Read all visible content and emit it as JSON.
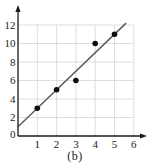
{
  "chart_data": {
    "type": "scatter",
    "title": "",
    "xlabel": "",
    "ylabel": "",
    "caption": "(b)",
    "points": [
      {
        "x": 1,
        "y": 3
      },
      {
        "x": 2,
        "y": 5
      },
      {
        "x": 3,
        "y": 6
      },
      {
        "x": 4,
        "y": 10
      },
      {
        "x": 5,
        "y": 11
      }
    ],
    "fit_line": {
      "x1": 0,
      "y1": 1,
      "x2": 5.6,
      "y2": 12.2
    },
    "xticks": [
      1,
      2,
      3,
      4,
      5,
      6
    ],
    "yticks": [
      0,
      2,
      4,
      6,
      8,
      10,
      12
    ],
    "xlim": [
      0,
      6.6
    ],
    "ylim": [
      0,
      13.5
    ],
    "grid": true,
    "grid_x_extent": 6,
    "grid_y_extent": 12,
    "colors": {
      "axis": "#1a1a1a",
      "grid": "#d6d6d6",
      "line": "#5d5d5d",
      "point": "#0d0d0d",
      "label": "#1c1c1c"
    }
  }
}
